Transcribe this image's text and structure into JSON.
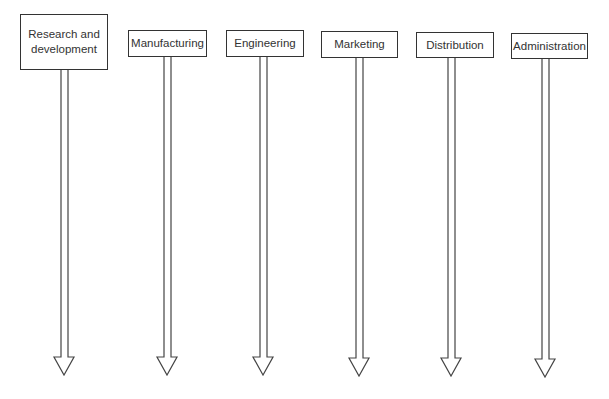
{
  "diagram": {
    "type": "functional-departments",
    "departments": [
      {
        "label": "Research and development",
        "line1": "Research and",
        "line2": "development"
      },
      {
        "label": "Manufacturing"
      },
      {
        "label": "Engineering"
      },
      {
        "label": "Marketing"
      },
      {
        "label": "Distribution"
      },
      {
        "label": "Administration"
      }
    ]
  }
}
